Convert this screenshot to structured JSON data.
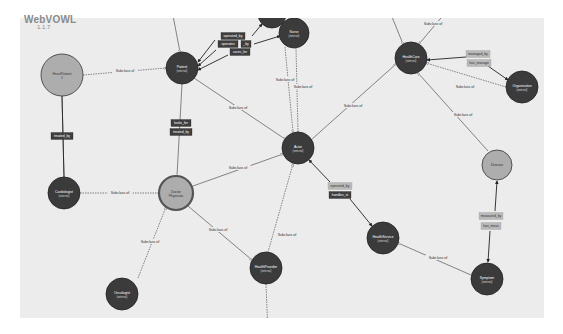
{
  "app": {
    "title": "WebVOWL",
    "version": "1.1.7"
  },
  "colors": {
    "canvas_bg": "#ececec",
    "external_class": "#3b3b3b",
    "light_class": "#adadad",
    "property_dark": "#3e3e3e",
    "property_light": "#b9b9b9",
    "edge": "#555555"
  },
  "nodes": [
    {
      "id": "heartpatient",
      "label": "HeartPatient",
      "sub": "1",
      "x": 62,
      "y": 75,
      "r": 21,
      "style": "light"
    },
    {
      "id": "patient",
      "label": "Patient",
      "sub": "(external)",
      "x": 182,
      "y": 68,
      "r": 16,
      "style": "external"
    },
    {
      "id": "topnode",
      "label": "",
      "sub": "",
      "x": 272,
      "y": 14,
      "r": 14,
      "style": "external"
    },
    {
      "id": "nurse",
      "label": "Nurse",
      "sub": "(external)",
      "x": 294,
      "y": 33,
      "r": 15,
      "style": "external"
    },
    {
      "id": "actor",
      "label": "Actor",
      "sub": "(external)",
      "x": 298,
      "y": 148,
      "r": 16,
      "style": "external"
    },
    {
      "id": "healthcare",
      "label": "HealthCare",
      "sub": "(external)",
      "x": 411,
      "y": 58,
      "r": 16,
      "style": "external"
    },
    {
      "id": "organization",
      "label": "Organization",
      "sub": "(external)",
      "x": 522,
      "y": 87,
      "r": 16,
      "style": "external"
    },
    {
      "id": "cardiologist",
      "label": "Cardiologist",
      "sub": "(external)",
      "x": 64,
      "y": 193,
      "r": 16,
      "style": "external"
    },
    {
      "id": "doctor",
      "label": "Doctor",
      "sub": "Physician",
      "x": 176,
      "y": 193,
      "r": 17,
      "style": "light-ring"
    },
    {
      "id": "disease",
      "label": "Disease",
      "sub": "",
      "x": 497,
      "y": 165,
      "r": 15,
      "style": "light"
    },
    {
      "id": "healthservice",
      "label": "HealthService",
      "sub": "(external)",
      "x": 383,
      "y": 238,
      "r": 16,
      "style": "external"
    },
    {
      "id": "oncologist",
      "label": "Oncologist",
      "sub": "(external)",
      "x": 122,
      "y": 294,
      "r": 16,
      "style": "external"
    },
    {
      "id": "healthprovider",
      "label": "HealthProvider",
      "sub": "(external)",
      "x": 266,
      "y": 268,
      "r": 16,
      "style": "external"
    },
    {
      "id": "symptom",
      "label": "Symptom",
      "sub": "(external)",
      "x": 487,
      "y": 279,
      "r": 16,
      "style": "external"
    }
  ],
  "edges": [
    {
      "x1": 83,
      "y1": 75,
      "x2": 166,
      "y2": 68,
      "dash": true,
      "label": "Subclass of",
      "lx": 125,
      "ly": 71
    },
    {
      "x1": 62,
      "y1": 96,
      "x2": 64,
      "y2": 177,
      "dash": false,
      "label": "",
      "lx": 0,
      "ly": 0
    },
    {
      "x1": 80,
      "y1": 193,
      "x2": 159,
      "y2": 193,
      "dash": true,
      "label": "Subclass of",
      "lx": 120,
      "ly": 193
    },
    {
      "x1": 182,
      "y1": 84,
      "x2": 177,
      "y2": 176,
      "dash": false,
      "label": "",
      "lx": 0,
      "ly": 0
    },
    {
      "x1": 138,
      "y1": 278,
      "x2": 166,
      "y2": 207,
      "dash": true,
      "label": "Subclass of",
      "lx": 150,
      "ly": 242
    },
    {
      "x1": 193,
      "y1": 186,
      "x2": 283,
      "y2": 154,
      "dash": false,
      "label": "Subclass of",
      "lx": 238,
      "ly": 168
    },
    {
      "x1": 188,
      "y1": 206,
      "x2": 252,
      "y2": 260,
      "dash": false,
      "label": "Subclass of",
      "lx": 218,
      "ly": 230
    },
    {
      "x1": 268,
      "y1": 252,
      "x2": 293,
      "y2": 164,
      "dash": true,
      "label": "Subclass of",
      "lx": 287,
      "ly": 235
    },
    {
      "x1": 194,
      "y1": 78,
      "x2": 285,
      "y2": 139,
      "dash": false,
      "label": "Subclass of",
      "lx": 238,
      "ly": 108
    },
    {
      "x1": 285,
      "y1": 47,
      "x2": 293,
      "y2": 132,
      "dash": true,
      "label": "Subclass of",
      "lx": 285,
      "ly": 80
    },
    {
      "x1": 296,
      "y1": 48,
      "x2": 298,
      "y2": 132,
      "dash": true,
      "label": "Subclass of",
      "lx": 303,
      "ly": 87
    },
    {
      "x1": 311,
      "y1": 140,
      "x2": 396,
      "y2": 64,
      "dash": false,
      "label": "Subclass of",
      "lx": 353,
      "ly": 106
    },
    {
      "x1": 390,
      "y1": 12,
      "x2": 403,
      "y2": 44,
      "dash": false,
      "label": "",
      "lx": 0,
      "ly": 0
    },
    {
      "x1": 446,
      "y1": 12,
      "x2": 419,
      "y2": 44,
      "dash": false,
      "label": "Subclass of",
      "lx": 433,
      "ly": 24
    },
    {
      "x1": 506,
      "y1": 87,
      "x2": 426,
      "y2": 63,
      "dash": true,
      "label": "Subclass of",
      "lx": 465,
      "ly": 87
    },
    {
      "x1": 488,
      "y1": 151,
      "x2": 418,
      "y2": 73,
      "dash": false,
      "label": "Subclass of",
      "lx": 463,
      "ly": 115
    },
    {
      "x1": 471,
      "y1": 275,
      "x2": 398,
      "y2": 243,
      "dash": false,
      "label": "Subclass of",
      "lx": 438,
      "ly": 258
    },
    {
      "x1": 266,
      "y1": 284,
      "x2": 268,
      "y2": 334,
      "dash": true,
      "label": "",
      "lx": 0,
      "ly": 0
    },
    {
      "x1": 170,
      "y1": 0,
      "x2": 180,
      "y2": 52,
      "dash": false,
      "label": "",
      "lx": 0,
      "ly": 0
    }
  ],
  "properties": [
    {
      "label": "treated_by",
      "x": 62,
      "y": 136,
      "w": 22,
      "style": "dark"
    },
    {
      "label": "looks_for",
      "x": 181,
      "y": 123,
      "w": 20,
      "style": "dark"
    },
    {
      "label": "treated_by",
      "x": 181,
      "y": 132,
      "w": 22,
      "style": "dark"
    },
    {
      "label": "operated_by",
      "x": 233,
      "y": 36,
      "w": 24,
      "style": "dark"
    },
    {
      "label": "operates",
      "x": 228,
      "y": 44,
      "w": 20,
      "style": "dark"
    },
    {
      "label": "_by",
      "x": 246,
      "y": 44,
      "w": 10,
      "style": "dark"
    },
    {
      "label": "cares_for",
      "x": 240,
      "y": 52,
      "w": 20,
      "style": "dark"
    },
    {
      "label": "managed_by",
      "x": 478,
      "y": 54,
      "w": 24,
      "style": "light"
    },
    {
      "label": "has_manage",
      "x": 479,
      "y": 63,
      "w": 24,
      "style": "light"
    },
    {
      "label": "operated_by",
      "x": 340,
      "y": 186,
      "w": 24,
      "style": "light"
    },
    {
      "label": "handles_st",
      "x": 340,
      "y": 195,
      "w": 22,
      "style": "dark"
    },
    {
      "label": "measured_by",
      "x": 491,
      "y": 216,
      "w": 24,
      "style": "light"
    },
    {
      "label": "has_meas",
      "x": 491,
      "y": 226,
      "w": 20,
      "style": "light"
    }
  ],
  "property_links": [
    {
      "x1": 62,
      "y1": 96,
      "x2": 64,
      "y2": 177
    },
    {
      "x1": 215,
      "y1": 40,
      "x2": 198,
      "y2": 62,
      "arrow": true
    },
    {
      "x1": 252,
      "y1": 36,
      "x2": 262,
      "y2": 24,
      "arrow": true
    },
    {
      "x1": 216,
      "y1": 50,
      "x2": 198,
      "y2": 66,
      "arrow": true
    },
    {
      "x1": 254,
      "y1": 44,
      "x2": 280,
      "y2": 36,
      "arrow": true
    },
    {
      "x1": 228,
      "y1": 55,
      "x2": 198,
      "y2": 70,
      "arrow": true
    },
    {
      "x1": 466,
      "y1": 57,
      "x2": 427,
      "y2": 60,
      "arrow": true
    },
    {
      "x1": 488,
      "y1": 66,
      "x2": 508,
      "y2": 80,
      "arrow": true
    },
    {
      "x1": 330,
      "y1": 182,
      "x2": 309,
      "y2": 160,
      "arrow": true
    },
    {
      "x1": 350,
      "y1": 199,
      "x2": 372,
      "y2": 226,
      "arrow": true
    },
    {
      "x1": 495,
      "y1": 211,
      "x2": 497,
      "y2": 181,
      "arrow": true
    },
    {
      "x1": 490,
      "y1": 231,
      "x2": 488,
      "y2": 262,
      "arrow": true
    }
  ]
}
